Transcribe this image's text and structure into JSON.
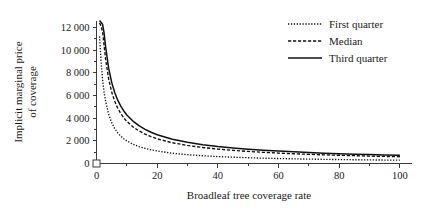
{
  "chart_data": {
    "type": "line",
    "title": "",
    "subtitle": "",
    "xlabel": "Broadleaf tree coverage rate",
    "ylabel_line1": "Implicit marginal price",
    "ylabel_line2": "of coverage",
    "xlim": [
      0,
      104
    ],
    "ylim": [
      0,
      12600
    ],
    "x_ticks": [
      0,
      20,
      40,
      60,
      80,
      100
    ],
    "x_tick_labels": [
      "0",
      "20",
      "40",
      "60",
      "80",
      "100"
    ],
    "x_minor_ticks": [
      10,
      30,
      50,
      70,
      90
    ],
    "y_ticks": [
      0,
      2000,
      4000,
      6000,
      8000,
      10000,
      12000
    ],
    "y_tick_labels": [
      "0",
      "2 000",
      "4 000",
      "6 000",
      "8 000",
      "10 000",
      "12 000"
    ],
    "y_minor_ticks": [
      1000,
      3000,
      5000,
      7000,
      9000,
      11000
    ],
    "grid": false,
    "legend_position": "top-right",
    "x": [
      1,
      1.5,
      2,
      2.5,
      3,
      4,
      5,
      6,
      7,
      8,
      9,
      10,
      12,
      14,
      16,
      18,
      20,
      25,
      30,
      35,
      40,
      45,
      50,
      55,
      60,
      65,
      70,
      75,
      80,
      85,
      90,
      95,
      100
    ],
    "series": [
      {
        "name": "First quarter",
        "style": "dotted",
        "values": [
          11200,
          9000,
          7400,
          6300,
          5500,
          4350,
          3600,
          3080,
          2700,
          2410,
          2180,
          1990,
          1700,
          1490,
          1330,
          1205,
          1100,
          905,
          775,
          680,
          610,
          553,
          508,
          470,
          438,
          411,
          387,
          366,
          348,
          332,
          317,
          304,
          292
        ]
      },
      {
        "name": "Median",
        "style": "dashed",
        "values": [
          12400,
          12100,
          11600,
          10400,
          9200,
          7450,
          6300,
          5480,
          4870,
          4400,
          4020,
          3710,
          3230,
          2870,
          2590,
          2360,
          2175,
          1830,
          1590,
          1410,
          1270,
          1157,
          1063,
          984,
          917,
          859,
          808,
          763,
          723,
          687,
          654,
          624,
          597
        ]
      },
      {
        "name": "Third quarter",
        "style": "solid",
        "values": [
          12600,
          12450,
          12250,
          11500,
          10300,
          8400,
          7150,
          6250,
          5580,
          5060,
          4630,
          4280,
          3740,
          3330,
          3010,
          2750,
          2535,
          2140,
          1865,
          1660,
          1500,
          1370,
          1262,
          1171,
          1093,
          1025,
          966,
          913,
          866,
          823,
          785,
          750,
          718
        ]
      }
    ],
    "legend_entries": [
      {
        "label": "First quarter",
        "style": "dotted"
      },
      {
        "label": "Median",
        "style": "dashed"
      },
      {
        "label": "Third quarter",
        "style": "solid"
      }
    ]
  }
}
